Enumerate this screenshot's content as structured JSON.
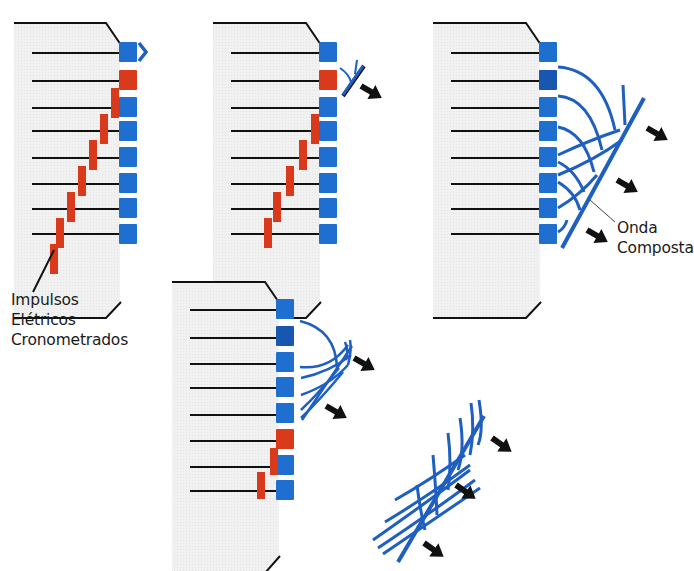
{
  "colors": {
    "element_blue": "#1f6fd1",
    "element_blue_dark": "#1857b0",
    "pulse_red": "#d93a1c",
    "wave_blue": "#1e5fc0",
    "housing_fill": "#eeeeee",
    "line": "#111111",
    "arrow": "#111111"
  },
  "labels": {
    "pulses": [
      "Impulsos",
      "Elétricos",
      "Cronometrados"
    ],
    "composite_wave": [
      "Onda",
      "Composta"
    ]
  },
  "panels": [
    {
      "id": "panel-1",
      "stage": "pulses traveling to elements; first element fires",
      "elements": 8,
      "fired_element": 1,
      "red_pulse_rows": [
        2,
        3,
        4,
        5,
        6,
        7,
        8
      ]
    },
    {
      "id": "panel-2",
      "stage": "first wavelets emitted",
      "elements": 8
    },
    {
      "id": "panel-3",
      "stage": "composite wave formed",
      "elements": 8
    },
    {
      "id": "panel-4",
      "stage": "last elements fire; wave front advancing",
      "elements": 8
    },
    {
      "id": "panel-5",
      "stage": "composite wave front propagating",
      "elements": 0
    }
  ]
}
